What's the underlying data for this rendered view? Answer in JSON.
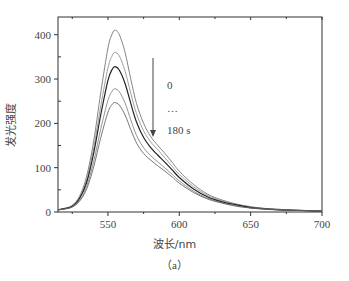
{
  "chart_data": {
    "type": "line",
    "title": "",
    "xlabel": "波长/nm",
    "ylabel": "发光强度",
    "caption": "（a）",
    "xlim": [
      515,
      700
    ],
    "ylim": [
      0,
      440
    ],
    "xticks": [
      550,
      600,
      650,
      700
    ],
    "yticks": [
      0,
      100,
      200,
      300,
      400
    ],
    "grid": false,
    "legend": "none",
    "annotations": {
      "arrow": "down",
      "start_label": "0",
      "ellipsis": "…",
      "end_label": "180 s"
    },
    "x": [
      515,
      520,
      525,
      530,
      535,
      540,
      545,
      550,
      553,
      555,
      558,
      562,
      566,
      570,
      575,
      580,
      585,
      590,
      595,
      600,
      610,
      620,
      630,
      640,
      650,
      660,
      670,
      680,
      690,
      700
    ],
    "series": [
      {
        "name": "0 s",
        "color": "#666666",
        "values": [
          5,
          8,
          15,
          35,
          80,
          160,
          270,
          370,
          402,
          410,
          400,
          360,
          300,
          245,
          200,
          170,
          150,
          132,
          112,
          92,
          62,
          40,
          27,
          18,
          12,
          8,
          6,
          4,
          3,
          2
        ]
      },
      {
        "name": "t2",
        "color": "#888888",
        "values": [
          5,
          8,
          14,
          32,
          72,
          145,
          240,
          325,
          353,
          360,
          352,
          318,
          268,
          222,
          183,
          158,
          140,
          122,
          103,
          85,
          57,
          37,
          25,
          17,
          11,
          8,
          6,
          4,
          3,
          2
        ]
      },
      {
        "name": "t3",
        "color": "#222222",
        "values": [
          5,
          8,
          13,
          30,
          66,
          133,
          220,
          297,
          322,
          328,
          320,
          290,
          245,
          203,
          168,
          145,
          128,
          112,
          95,
          78,
          52,
          34,
          23,
          16,
          10,
          7,
          5,
          4,
          3,
          2
        ]
      },
      {
        "name": "t4",
        "color": "#777777",
        "values": [
          5,
          7,
          12,
          26,
          57,
          114,
          188,
          252,
          273,
          278,
          271,
          246,
          208,
          173,
          145,
          127,
          113,
          99,
          85,
          70,
          47,
          31,
          21,
          14,
          9,
          7,
          5,
          4,
          3,
          2
        ]
      },
      {
        "name": "180 s",
        "color": "#555555",
        "values": [
          5,
          7,
          11,
          24,
          51,
          102,
          168,
          225,
          243,
          247,
          241,
          219,
          186,
          156,
          132,
          117,
          104,
          92,
          79,
          65,
          44,
          29,
          20,
          13,
          9,
          6,
          5,
          4,
          3,
          2
        ]
      }
    ]
  }
}
